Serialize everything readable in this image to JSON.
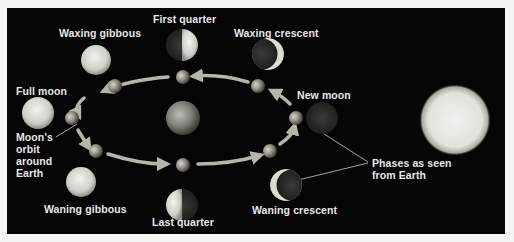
{
  "diagram": {
    "background_color": "#050505",
    "page_color": "#f4f4f2",
    "label_color": "#e8e8e8",
    "orbit_arrow_color": "#b5b5ad",
    "phases": [
      {
        "id": "first-quarter",
        "label": "First quarter"
      },
      {
        "id": "waxing-gibbous",
        "label": "Waxing gibbous"
      },
      {
        "id": "waxing-crescent",
        "label": "Waxing crescent"
      },
      {
        "id": "full-moon",
        "label": "Full moon"
      },
      {
        "id": "new-moon",
        "label": "New moon"
      },
      {
        "id": "waning-gibbous",
        "label": "Waning gibbous"
      },
      {
        "id": "last-quarter",
        "label": "Last quarter"
      },
      {
        "id": "waning-crescent",
        "label": "Waning crescent"
      }
    ],
    "annotations": {
      "orbit_label": "Moon's orbit around Earth",
      "orbit_label_lines": [
        "Moon's",
        "orbit",
        "around",
        "Earth"
      ],
      "phases_label_lines": [
        "Phases as seen",
        "from Earth"
      ],
      "phases_label": "Phases as seen from Earth"
    },
    "objects": {
      "earth": "center",
      "sun": "right",
      "orbit_moons_count": 8
    }
  }
}
